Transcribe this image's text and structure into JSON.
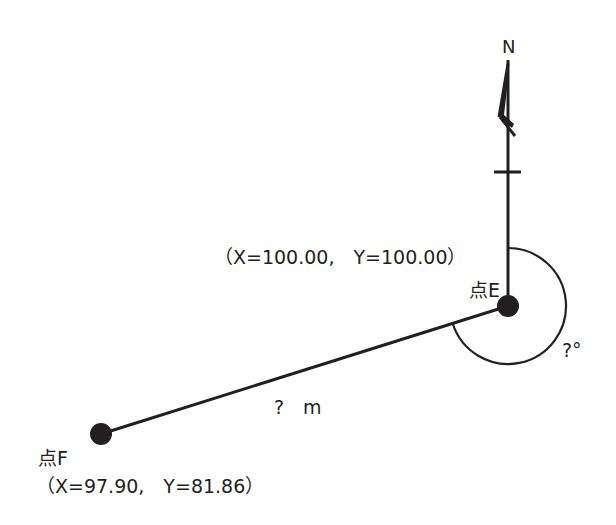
{
  "diagram": {
    "type": "survey-bearing-distance",
    "north_label": "N",
    "points": [
      {
        "id": "E",
        "label": "点E",
        "coords_label": "（X=100.00,　Y=100.00）",
        "x": 100.0,
        "y": 100.0
      },
      {
        "id": "F",
        "label": "点F",
        "coords_label": "（X=97.90,　Y=81.86）",
        "x": 97.9,
        "y": 81.86
      }
    ],
    "segment": {
      "from": "E",
      "to": "F",
      "distance_label": "?　m"
    },
    "angle": {
      "vertex": "E",
      "from": "N",
      "to": "F",
      "direction": "clockwise",
      "label": "?°"
    },
    "colors": {
      "ink": "#231f20",
      "background": "#ffffff"
    }
  }
}
